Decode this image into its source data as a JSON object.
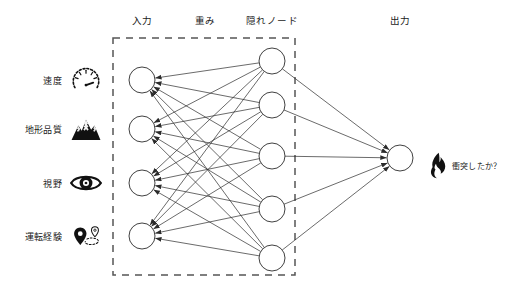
{
  "diagram": {
    "colors": {
      "stroke": "#2b2b2b",
      "node_fill": "#ffffff",
      "dashed_box": "#555555",
      "text": "#1a1a1a",
      "icon": "#111111"
    },
    "headers": [
      {
        "label": "入力",
        "x": 142,
        "y": 20
      },
      {
        "label": "重み",
        "x": 205,
        "y": 20
      },
      {
        "label": "隠れノード",
        "x": 272,
        "y": 20
      },
      {
        "label": "出力",
        "x": 400,
        "y": 20
      }
    ],
    "dashed_box": {
      "x": 113,
      "y": 38,
      "width": 182,
      "height": 237
    },
    "inputs": [
      {
        "label": "速度",
        "icon": "speedometer-icon",
        "label_x": 62,
        "icon_x": 86,
        "y": 80,
        "node_x": 142
      },
      {
        "label": "地形品質",
        "icon": "mountain-icon",
        "label_x": 62,
        "icon_x": 86,
        "y": 129,
        "node_x": 142
      },
      {
        "label": "視野",
        "icon": "eye-icon",
        "label_x": 62,
        "icon_x": 86,
        "y": 183,
        "node_x": 142
      },
      {
        "label": "運転経験",
        "icon": "route-pin-icon",
        "label_x": 62,
        "icon_x": 88,
        "y": 236,
        "node_x": 142
      }
    ],
    "hidden_nodes": [
      {
        "name": "hidden-node-1",
        "x": 272,
        "y": 61
      },
      {
        "name": "hidden-node-2",
        "x": 272,
        "y": 105
      },
      {
        "name": "hidden-node-3",
        "x": 272,
        "y": 156
      },
      {
        "name": "hidden-node-4",
        "x": 272,
        "y": 209
      },
      {
        "name": "hidden-node-5",
        "x": 272,
        "y": 258
      }
    ],
    "output": {
      "node_x": 400,
      "node_y": 158,
      "icon": "flame-icon",
      "icon_x": 438,
      "icon_y": 165,
      "label": "衝突したか？",
      "label_x": 452,
      "label_y": 165
    },
    "node_radius": 13,
    "line_width": 0.7,
    "arrow_style": "filled-triangle"
  },
  "chart_data": {
    "type": "diagram",
    "network": "feedforward",
    "layers": [
      {
        "name": "入力",
        "node_count": 4,
        "labels": [
          "速度",
          "地形品質",
          "視野",
          "運転経験"
        ]
      },
      {
        "name": "隠れノード",
        "node_count": 5,
        "labels": []
      },
      {
        "name": "出力",
        "node_count": 1,
        "labels": [
          "衝突したか？"
        ]
      }
    ],
    "edge_label": "重み",
    "edges_input_to_hidden": 20,
    "edges_hidden_to_output": 5
  }
}
